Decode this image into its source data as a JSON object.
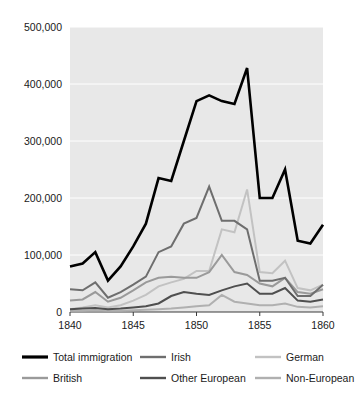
{
  "chart_data": {
    "type": "line",
    "title": "",
    "subtitle": "",
    "xlabel": "",
    "ylabel": "",
    "xlim": [
      1840,
      1860
    ],
    "ylim": [
      0,
      500000
    ],
    "grid": true,
    "legend_position": "below",
    "x_ticks": [
      "1840",
      "1845",
      "1850",
      "1855",
      "1860"
    ],
    "x_tick_values": [
      1840,
      1845,
      1850,
      1855,
      1860
    ],
    "y_ticks": [
      "0",
      "100,000",
      "200,000",
      "300,000",
      "400,000",
      "500,000"
    ],
    "y_tick_values": [
      0,
      100000,
      200000,
      300000,
      400000,
      500000
    ],
    "x": [
      1840,
      1841,
      1842,
      1843,
      1844,
      1845,
      1846,
      1847,
      1848,
      1849,
      1850,
      1851,
      1852,
      1853,
      1854,
      1855,
      1856,
      1857,
      1858,
      1859,
      1860
    ],
    "series": [
      {
        "name": "Total immigration",
        "color": "#000000",
        "width": 2.6,
        "values": [
          80000,
          85000,
          105000,
          55000,
          80000,
          115000,
          155000,
          235000,
          230000,
          300000,
          370000,
          380000,
          370000,
          365000,
          428000,
          200000,
          200000,
          250000,
          125000,
          120000,
          153000
        ]
      },
      {
        "name": "British",
        "color": "#9a9a9a",
        "width": 2.0,
        "values": [
          20000,
          22000,
          35000,
          18000,
          25000,
          38000,
          52000,
          60000,
          62000,
          60000,
          60000,
          70000,
          100000,
          70000,
          65000,
          50000,
          45000,
          60000,
          35000,
          32000,
          40000
        ]
      },
      {
        "name": "Irish",
        "color": "#6e6e6e",
        "width": 2.0,
        "values": [
          40000,
          38000,
          52000,
          25000,
          35000,
          48000,
          62000,
          105000,
          115000,
          155000,
          165000,
          220000,
          160000,
          160000,
          145000,
          55000,
          55000,
          60000,
          28000,
          28000,
          48000
        ]
      },
      {
        "name": "Other European",
        "color": "#4f4f4f",
        "width": 2.0,
        "values": [
          5000,
          6000,
          7000,
          5000,
          6000,
          8000,
          10000,
          15000,
          28000,
          35000,
          32000,
          30000,
          38000,
          45000,
          50000,
          32000,
          32000,
          42000,
          20000,
          18000,
          22000
        ]
      },
      {
        "name": "German",
        "color": "#c2c2c2",
        "width": 2.0,
        "values": [
          5000,
          8000,
          12000,
          8000,
          12000,
          20000,
          30000,
          45000,
          52000,
          58000,
          72000,
          72000,
          145000,
          140000,
          215000,
          70000,
          68000,
          90000,
          42000,
          38000,
          48000
        ]
      },
      {
        "name": "Non-European",
        "color": "#b0b0b0",
        "width": 2.0,
        "values": [
          2000,
          2000,
          3000,
          2000,
          2000,
          3000,
          4000,
          5000,
          6000,
          8000,
          10000,
          12000,
          30000,
          18000,
          15000,
          12000,
          12000,
          15000,
          9000,
          8000,
          10000
        ]
      }
    ]
  },
  "legend": {
    "entries": [
      {
        "label": "Total immigration",
        "color": "#000000",
        "col": 0,
        "row": 0
      },
      {
        "label": "Irish",
        "color": "#6e6e6e",
        "col": 1,
        "row": 0
      },
      {
        "label": "German",
        "color": "#c2c2c2",
        "col": 2,
        "row": 0
      },
      {
        "label": "British",
        "color": "#9a9a9a",
        "col": 0,
        "row": 1
      },
      {
        "label": "Other European",
        "color": "#4f4f4f",
        "col": 1,
        "row": 1
      },
      {
        "label": "Non-European",
        "color": "#b0b0b0",
        "col": 2,
        "row": 1
      }
    ]
  },
  "colors": {
    "plot_background": "#e8e8e8",
    "gridline": "#ffffff",
    "axis": "#3a3a3a",
    "text": "#1a1a1a",
    "page_background": "#ffffff"
  }
}
